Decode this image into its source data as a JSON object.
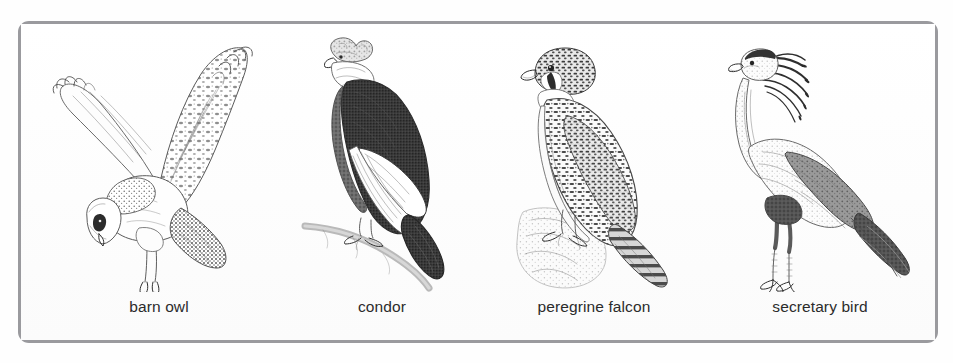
{
  "figure": {
    "frame_color": "#9a9a9e",
    "background_color": "#ffffff",
    "ink_color": "#4c4c4c",
    "caption_color": "#2b2b2b",
    "panel_count": 4
  },
  "birds": [
    {
      "id": "barn-owl",
      "label": "barn owl",
      "pose": "in flight, wings raised, viewed from the left",
      "icon": "barn-owl-illustration"
    },
    {
      "id": "condor",
      "label": "condor",
      "pose": "perched upright on a branch, facing left",
      "icon": "condor-illustration"
    },
    {
      "id": "peregrine-falcon",
      "label": "peregrine falcon",
      "pose": "perched on a rock, facing left",
      "icon": "peregrine-falcon-illustration"
    },
    {
      "id": "secretary-bird",
      "label": "secretary bird",
      "pose": "standing on long legs, crest raised, facing left",
      "icon": "secretary-bird-illustration"
    }
  ]
}
